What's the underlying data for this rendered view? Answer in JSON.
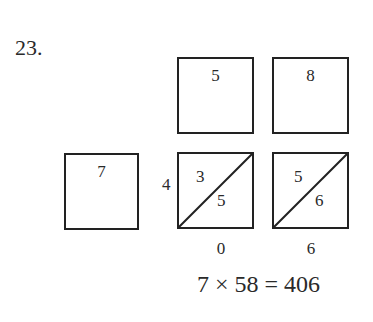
{
  "problem": {
    "number": "23."
  },
  "top_row": {
    "digits": [
      "5",
      "8"
    ]
  },
  "left_box": {
    "digit": "7"
  },
  "side_carry": "4",
  "lattice": [
    {
      "upper": "3",
      "lower": "5"
    },
    {
      "upper": "5",
      "lower": "6"
    }
  ],
  "result_digits": [
    "0",
    "6"
  ],
  "equation": "7 × 58 = 406"
}
